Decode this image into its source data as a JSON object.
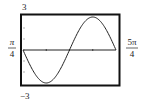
{
  "chart_data": {
    "type": "line",
    "title": "",
    "function": "y = 3cos(2x)",
    "xlabel": "",
    "ylabel": "",
    "xlim_label": {
      "min": "π/4",
      "max": "5π/4"
    },
    "xlim": [
      0.7854,
      3.927
    ],
    "ylim": [
      -3,
      3
    ],
    "ylim_label": {
      "min": "−3",
      "max": "3"
    },
    "x_ticks": [
      1.5708,
      2.3562,
      3.1416
    ],
    "y_ticks": [
      -2,
      -1,
      0,
      1,
      2
    ],
    "grid": false,
    "series": [
      {
        "name": "3cos(2x)",
        "x": [
          0.7854,
          1.1781,
          1.5708,
          1.9635,
          2.3562,
          2.7489,
          3.1416,
          3.5343,
          3.927
        ],
        "values": [
          0,
          -2.121,
          -3,
          -2.121,
          0,
          2.121,
          3,
          2.121,
          0
        ]
      }
    ],
    "labels": {
      "ymax": "3",
      "ymin": "−3",
      "xmin_num": "π",
      "xmin_den": "4",
      "xmax_num": "5π",
      "xmax_den": "4"
    }
  },
  "colors": {
    "frame": "#111111",
    "curve": "#222222",
    "axis": "#222222"
  }
}
